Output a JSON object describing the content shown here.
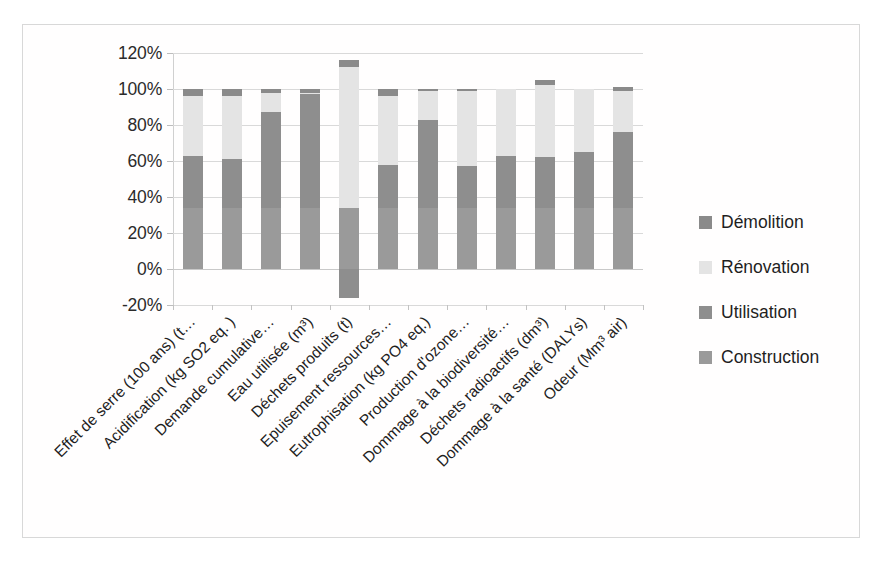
{
  "chart_data": {
    "type": "bar",
    "title": "",
    "subtitle": "",
    "xlabel": "",
    "ylabel": "",
    "stacked": true,
    "normalized_percent": true,
    "grid": true,
    "legend_position": "right",
    "ylim": [
      -20,
      120
    ],
    "ytick_values": [
      120,
      100,
      80,
      60,
      40,
      20,
      0,
      -20
    ],
    "ytick_labels": [
      "120%",
      "100%",
      "80%",
      "60%",
      "40%",
      "20%",
      "0%",
      "-20%"
    ],
    "categories": [
      "Effet de serre (100 ans) (t…",
      "Acidification (kg SO2 eq. )",
      "Demande cumulative…",
      "Eau utilisée (m³)",
      "Déchets produits (t)",
      "Epuisement ressources…",
      "Eutrophisation (kg PO4 eq.)",
      "Production d'ozone…",
      "Dommage à la biodiversité…",
      "Déchets radioactifs (dm³)",
      "Dommage à la santé (DALYs)",
      "Odeur (Mm³ air)"
    ],
    "series": [
      {
        "name": "Construction",
        "color": "#9a9a9a",
        "values": [
          34,
          34,
          34,
          34,
          34,
          34,
          34,
          34,
          34,
          34,
          34,
          34
        ]
      },
      {
        "name": "Utilisation",
        "color": "#8e8e8e",
        "values": [
          29,
          27,
          53,
          63,
          -16,
          24,
          49,
          23,
          29,
          28,
          31,
          42
        ]
      },
      {
        "name": "Rénovation",
        "color": "#e4e4e4",
        "values": [
          33,
          35,
          11,
          1,
          78,
          38,
          16,
          42,
          37,
          40,
          35,
          23
        ]
      },
      {
        "name": "Démolition",
        "color": "#8a8a8a",
        "values": [
          4,
          4,
          2,
          2,
          4,
          4,
          1,
          1,
          0,
          3,
          0,
          2
        ]
      }
    ],
    "bar_tops_percent": [
      100,
      100,
      100,
      100,
      100,
      100,
      100,
      100,
      100,
      105,
      100,
      101
    ],
    "bar_bottoms_percent": [
      0,
      0,
      0,
      0,
      -16,
      0,
      0,
      0,
      0,
      -3,
      0,
      0
    ]
  },
  "legend": {
    "items": [
      {
        "label": "Démolition",
        "color": "#8a8a8a"
      },
      {
        "label": "Rénovation",
        "color": "#e4e4e4"
      },
      {
        "label": "Utilisation",
        "color": "#8e8e8e"
      },
      {
        "label": "Construction",
        "color": "#9a9a9a"
      }
    ]
  },
  "caption": {
    "text": ""
  }
}
